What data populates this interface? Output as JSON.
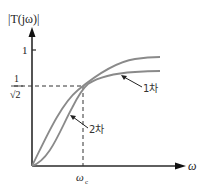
{
  "diagram": {
    "title": "|T(jω)|",
    "y_axis": {
      "label": "|T(jω)|",
      "ticks": [
        {
          "label": "1"
        },
        {
          "label_num": "1",
          "label_den": "√2"
        }
      ]
    },
    "x_axis": {
      "label": "ω",
      "ticks": [
        {
          "label": "ω",
          "subscript": "c"
        }
      ]
    },
    "curves": [
      {
        "name": "1차",
        "label": "1차",
        "description": "first-order low-pass magnitude response"
      },
      {
        "name": "2차",
        "label": "2차",
        "description": "second-order response, S-shaped"
      }
    ],
    "annotations": {
      "cutoff_point": "intersection at ωc, magnitude 1/√2"
    },
    "colors": {
      "axis": "#2a2a2a",
      "curve": "#8a8a8a",
      "dashed": "#333333"
    }
  }
}
